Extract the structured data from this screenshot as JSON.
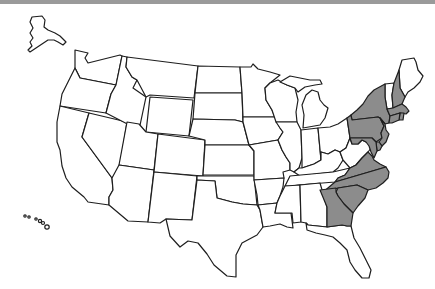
{
  "map": {
    "subject": "United States",
    "highlight_color": "#8c8c8c",
    "base_color": "#ffffff",
    "border_color": "#1e1e1e",
    "top_bar_color": "#9a9a9a",
    "highlighted_states": [
      "NH",
      "MA",
      "RI",
      "CT",
      "NY",
      "NJ",
      "PA",
      "DE",
      "MD",
      "VA",
      "NC",
      "SC",
      "GA"
    ],
    "states": [
      {
        "id": "WA"
      },
      {
        "id": "OR"
      },
      {
        "id": "CA"
      },
      {
        "id": "NV"
      },
      {
        "id": "ID"
      },
      {
        "id": "MT"
      },
      {
        "id": "WY"
      },
      {
        "id": "UT"
      },
      {
        "id": "AZ"
      },
      {
        "id": "CO"
      },
      {
        "id": "NM"
      },
      {
        "id": "ND"
      },
      {
        "id": "SD"
      },
      {
        "id": "NE"
      },
      {
        "id": "KS"
      },
      {
        "id": "OK"
      },
      {
        "id": "TX"
      },
      {
        "id": "MN"
      },
      {
        "id": "IA"
      },
      {
        "id": "MO"
      },
      {
        "id": "AR"
      },
      {
        "id": "LA"
      },
      {
        "id": "WI"
      },
      {
        "id": "IL"
      },
      {
        "id": "MI"
      },
      {
        "id": "IN"
      },
      {
        "id": "OH"
      },
      {
        "id": "KY"
      },
      {
        "id": "TN"
      },
      {
        "id": "MS"
      },
      {
        "id": "AL"
      },
      {
        "id": "FL"
      },
      {
        "id": "WV"
      },
      {
        "id": "ME"
      },
      {
        "id": "VT"
      },
      {
        "id": "AK"
      },
      {
        "id": "HI"
      }
    ]
  }
}
